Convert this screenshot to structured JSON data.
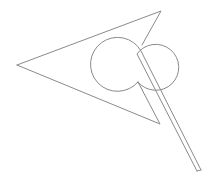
{
  "figure": {
    "stroke_color": "#8a8a8a",
    "background_color": "#ffffff"
  }
}
